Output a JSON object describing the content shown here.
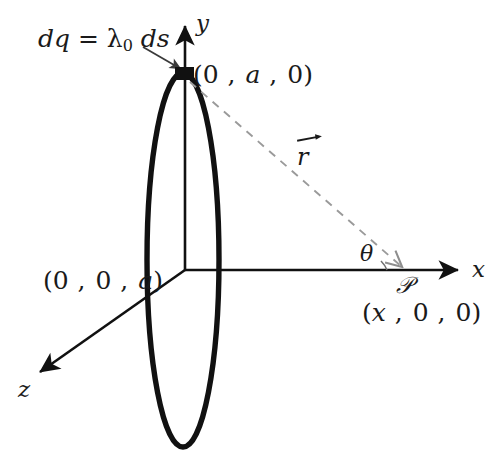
{
  "figure": {
    "background_color": "#ffffff",
    "ink_color": "#111111",
    "dashed_color": "#9a9a9a"
  },
  "axes": {
    "x_label": "x",
    "y_label": "y",
    "z_label": "z"
  },
  "labels": {
    "dq_expression_lead": "dq",
    "dq_equals": " = ",
    "dq_lambda": "λ",
    "dq_subscript": "0",
    "dq_ds": " ds",
    "dq_full": "dq = λ0 ds",
    "ring_top_point": "(0 , a , 0)",
    "ring_z_point": "(0 , 0 , a)",
    "field_point_coords": "(x , 0 , 0)",
    "field_point_symbol": "𝒫",
    "r_vector": "r",
    "theta": "θ"
  },
  "coords": {
    "ring_top": {
      "open": "(",
      "c1": "0",
      "sep1": " , ",
      "c2": "a",
      "sep2": " , ",
      "c3": "0",
      "close": ")"
    },
    "ring_z": {
      "open": "(",
      "c1": "0",
      "sep1": " , ",
      "c2": "0",
      "sep2": " , ",
      "c3": "a",
      "close": ")"
    },
    "point_p": {
      "open": "(",
      "c1": "x",
      "sep1": " , ",
      "c2": "0",
      "sep2": " , ",
      "c3": "0",
      "close": ")"
    }
  },
  "geometry": {
    "origin_x": 185,
    "origin_y": 270,
    "ring_center_x": 183,
    "ring_center_y": 260,
    "ring_rx": 36,
    "ring_ry": 188,
    "charge_element_x": 184,
    "charge_element_y": 74,
    "field_point_x": 405,
    "field_point_y": 270,
    "x_axis_tip": 465,
    "y_axis_tip": 18,
    "z_axis_tip_x": 33,
    "z_axis_tip_y": 377
  }
}
